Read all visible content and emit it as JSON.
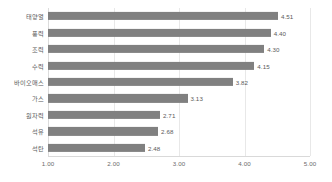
{
  "chart_data": {
    "type": "bar",
    "orientation": "horizontal",
    "title": "",
    "subtitle": "",
    "xlabel": "",
    "ylabel": "",
    "xlim": [
      1.0,
      5.0
    ],
    "xticks": [
      "1.00",
      "2.00",
      "3.00",
      "4.00",
      "5.00"
    ],
    "xtick_values": [
      1.0,
      2.0,
      3.0,
      4.0,
      5.0
    ],
    "grid": true,
    "grid_axis": "x",
    "legend": false,
    "legend_position": "none",
    "bar_color": "#808080",
    "label_color": "#5a5a5a",
    "categories": [
      "태양열",
      "풍력",
      "조력",
      "수력",
      "바이오매스",
      "가스",
      "원자력",
      "석유",
      "석탄"
    ],
    "values": [
      4.51,
      4.4,
      4.3,
      4.15,
      3.82,
      3.13,
      2.71,
      2.68,
      2.48
    ],
    "value_labels": [
      "4.51",
      "4.40",
      "4.30",
      "4.15",
      "3.82",
      "3.13",
      "2.71",
      "2.68",
      "2.48"
    ]
  }
}
